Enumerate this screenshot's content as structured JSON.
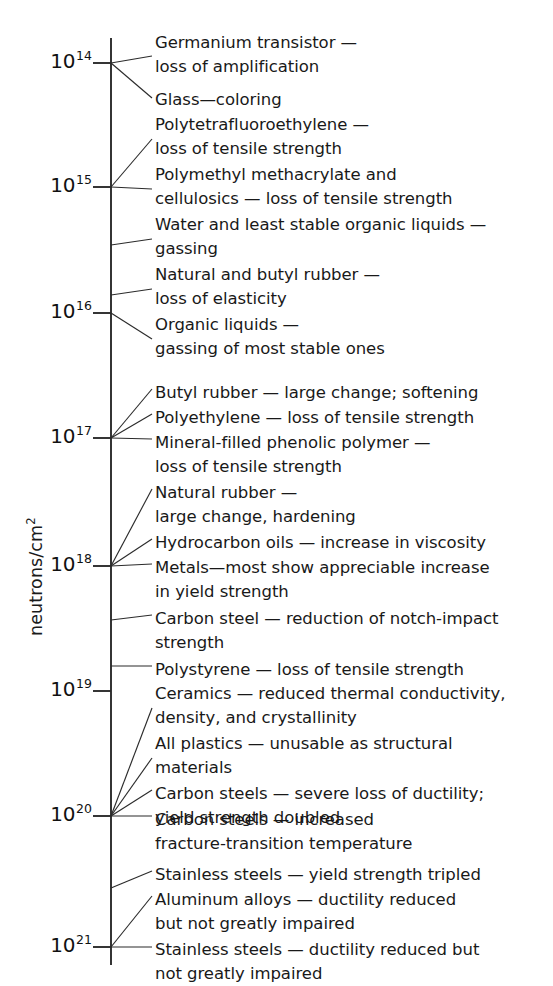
{
  "axis": {
    "title": "neutrons/cm",
    "title_exponent": "2",
    "line_x": 111,
    "line_top": 38,
    "line_bottom": 965,
    "tick_labels": [
      {
        "base": "10",
        "exponent": "14",
        "value": 100000000000000.0,
        "y": 63
      },
      {
        "base": "10",
        "exponent": "15",
        "value": 1000000000000000.0,
        "y": 187
      },
      {
        "base": "10",
        "exponent": "16",
        "value": 1e+16,
        "y": 313
      },
      {
        "base": "10",
        "exponent": "17",
        "value": 1e+17,
        "y": 438
      },
      {
        "base": "10",
        "exponent": "18",
        "value": 1e+18,
        "y": 566
      },
      {
        "base": "10",
        "exponent": "19",
        "value": 1e+19,
        "y": 691
      },
      {
        "base": "10",
        "exponent": "20",
        "value": 1e+20,
        "y": 816
      },
      {
        "base": "10",
        "exponent": "21",
        "value": 1e+21,
        "y": 947
      }
    ]
  },
  "annotations": [
    {
      "id": "germanium-transistor",
      "text": "Germanium transistor —\nloss of amplification",
      "y": 31,
      "anchor_y": 63,
      "leader_to_y": 56
    },
    {
      "id": "glass-coloring",
      "text": "Glass—coloring",
      "y": 88,
      "anchor_y": 63,
      "leader_to_y": 98
    },
    {
      "id": "ptfe",
      "text": "Polytetrafluoroethylene —\nloss of tensile strength",
      "y": 113,
      "anchor_y": 187,
      "leader_to_y": 139
    },
    {
      "id": "pmma-cellulosics",
      "text": "Polymethyl methacrylate and\ncellulosics — loss of tensile strength",
      "y": 163,
      "anchor_y": 187,
      "leader_to_y": 189
    },
    {
      "id": "water-organic-liquids",
      "text": "Water and least stable organic liquids —\ngassing",
      "y": 213,
      "anchor_y": 245,
      "leader_to_y": 239
    },
    {
      "id": "natural-butyl-rubber",
      "text": "Natural and butyl rubber —\nloss of elasticity",
      "y": 263,
      "anchor_y": 295,
      "leader_to_y": 289
    },
    {
      "id": "organic-liquids",
      "text": "Organic liquids —\ngassing of most stable ones",
      "y": 313,
      "anchor_y": 313,
      "leader_to_y": 339
    },
    {
      "id": "butyl-rubber",
      "text": "Butyl rubber — large change; softening",
      "y": 381,
      "anchor_y": 438,
      "leader_to_y": 389
    },
    {
      "id": "polyethylene",
      "text": "Polyethylene — loss of tensile strength",
      "y": 406,
      "anchor_y": 438,
      "leader_to_y": 414
    },
    {
      "id": "mineral-filled-phenolic",
      "text": "Mineral-filled phenolic polymer —\nloss of tensile strength",
      "y": 431,
      "anchor_y": 438,
      "leader_to_y": 439
    },
    {
      "id": "natural-rubber",
      "text": "Natural rubber —\nlarge change, hardening",
      "y": 481,
      "anchor_y": 566,
      "leader_to_y": 489
    },
    {
      "id": "hydrocarbon-oils",
      "text": "Hydrocarbon oils — increase in viscosity",
      "y": 531,
      "anchor_y": 566,
      "leader_to_y": 539
    },
    {
      "id": "metals-yield",
      "text": "Metals—most show appreciable increase\nin yield strength",
      "y": 556,
      "anchor_y": 566,
      "leader_to_y": 564
    },
    {
      "id": "carbon-steel-notch",
      "text": "Carbon steel — reduction of notch-impact\nstrength",
      "y": 607,
      "anchor_y": 620,
      "leader_to_y": 615
    },
    {
      "id": "polystyrene",
      "text": "Polystyrene — loss of tensile strength",
      "y": 658,
      "anchor_y": 666,
      "leader_to_y": 666
    },
    {
      "id": "ceramics",
      "text": "Ceramics — reduced thermal conductivity,\ndensity, and crystallinity",
      "y": 682,
      "anchor_y": 816,
      "leader_to_y": 708
    },
    {
      "id": "all-plastics",
      "text": "All plastics — unusable as structural\nmaterials",
      "y": 732,
      "anchor_y": 816,
      "leader_to_y": 758
    },
    {
      "id": "carbon-steels-ductility",
      "text": "Carbon steels — severe loss of ductility;\nyield strength doubled",
      "y": 782,
      "anchor_y": 816,
      "leader_to_y": 790
    },
    {
      "id": "carbon-steels-fracture",
      "text": "Carbon steels — increased\nfracture-transition temperature",
      "y": 808,
      "anchor_y": 816,
      "leader_to_y": 816
    },
    {
      "id": "stainless-yield",
      "text": "Stainless steels — yield strength tripled",
      "y": 863,
      "anchor_y": 888,
      "leader_to_y": 871
    },
    {
      "id": "aluminum-alloys",
      "text": "Aluminum alloys — ductility reduced\nbut not greatly impaired",
      "y": 888,
      "anchor_y": 947,
      "leader_to_y": 896
    },
    {
      "id": "stainless-ductility",
      "text": "Stainless steels — ductility reduced but\nnot greatly impaired",
      "y": 938,
      "anchor_y": 947,
      "leader_to_y": 947
    }
  ],
  "chart_data": {
    "type": "scatter",
    "title": "",
    "xlabel": "",
    "ylabel": "neutrons/cm2",
    "ylim": [
      100000000000000.0,
      1e+21
    ],
    "yscale": "log",
    "grid": false,
    "legend": "none",
    "ytick_labels": [
      "10^14",
      "10^15",
      "10^16",
      "10^17",
      "10^18",
      "10^19",
      "10^20",
      "10^21"
    ],
    "ytick_values": [
      100000000000000.0,
      1000000000000000.0,
      1e+16,
      1e+17,
      1e+18,
      1e+19,
      1e+20,
      1e+21
    ],
    "annotations": [
      {
        "label": "Germanium transistor — loss of amplification",
        "value": 100000000000000.0
      },
      {
        "label": "Glass—coloring",
        "value": 100000000000000.0
      },
      {
        "label": "Polytetrafluoroethylene — loss of tensile strength",
        "value": 1000000000000000.0
      },
      {
        "label": "Polymethyl methacrylate and cellulosics — loss of tensile strength",
        "value": 1000000000000000.0
      },
      {
        "label": "Water and least stable organic liquids — gassing",
        "value": 3000000000000000.0
      },
      {
        "label": "Natural and butyl rubber — loss of elasticity",
        "value": 7000000000000000.0
      },
      {
        "label": "Organic liquids — gassing of most stable ones",
        "value": 1e+16
      },
      {
        "label": "Butyl rubber — large change; softening",
        "value": 1e+17
      },
      {
        "label": "Polyethylene — loss of tensile strength",
        "value": 1e+17
      },
      {
        "label": "Mineral-filled phenolic polymer — loss of tensile strength",
        "value": 1e+17
      },
      {
        "label": "Natural rubber — large change, hardening",
        "value": 1e+18
      },
      {
        "label": "Hydrocarbon oils — increase in viscosity",
        "value": 1e+18
      },
      {
        "label": "Metals—most show appreciable increase in yield strength",
        "value": 1e+18
      },
      {
        "label": "Carbon steel — reduction of notch-impact strength",
        "value": 1.9e+18
      },
      {
        "label": "Polystyrene — loss of tensile strength",
        "value": 5e+18
      },
      {
        "label": "Ceramics — reduced thermal conductivity, density, and crystallinity",
        "value": 1e+20
      },
      {
        "label": "All plastics — unusable as structural materials",
        "value": 1e+20
      },
      {
        "label": "Carbon steels — severe loss of ductility; yield strength doubled",
        "value": 1e+20
      },
      {
        "label": "Carbon steels — increased fracture-transition temperature",
        "value": 1e+20
      },
      {
        "label": "Stainless steels — yield strength tripled",
        "value": 3e+20
      },
      {
        "label": "Aluminum alloys — ductility reduced but not greatly impaired",
        "value": 1e+21
      },
      {
        "label": "Stainless steels — ductility reduced but not greatly impaired",
        "value": 1e+21
      }
    ]
  }
}
